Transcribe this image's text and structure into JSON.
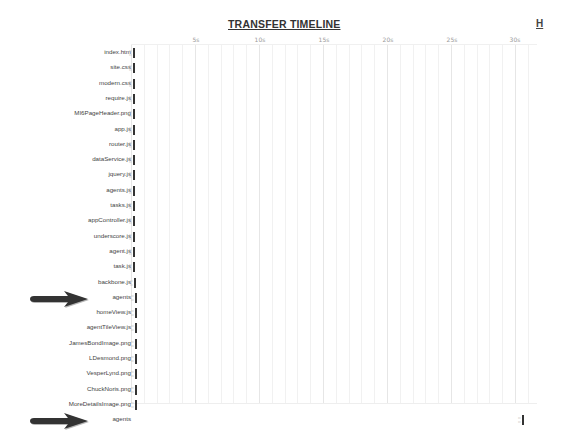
{
  "header": {
    "title": "TRANSFER TIMELINE",
    "corner_link": "H"
  },
  "axis": {
    "ticks": [
      {
        "label": "5s",
        "x": 196
      },
      {
        "label": "10s",
        "x": 260
      },
      {
        "label": "15s",
        "x": 324
      },
      {
        "label": "20s",
        "x": 388
      },
      {
        "label": "25s",
        "x": 452
      },
      {
        "label": "30s",
        "x": 515
      }
    ]
  },
  "timeline": {
    "rows": [
      {
        "label": "index.htm",
        "bar_x": 133
      },
      {
        "label": "site.css",
        "bar_x": 133
      },
      {
        "label": "modern.css",
        "bar_x": 133
      },
      {
        "label": "require.js",
        "bar_x": 133
      },
      {
        "label": "MI6PageHeader.png",
        "bar_x": 133
      },
      {
        "label": "app.js",
        "bar_x": 133
      },
      {
        "label": "router.js",
        "bar_x": 133
      },
      {
        "label": "dataService.js",
        "bar_x": 133
      },
      {
        "label": "jquery.js",
        "bar_x": 133
      },
      {
        "label": "agents.js",
        "bar_x": 133
      },
      {
        "label": "tasks.js",
        "bar_x": 133
      },
      {
        "label": "appController.js",
        "bar_x": 133
      },
      {
        "label": "underscore.js",
        "bar_x": 133
      },
      {
        "label": "agent.js",
        "bar_x": 133
      },
      {
        "label": "task.js",
        "bar_x": 133
      },
      {
        "label": "backbone.js",
        "bar_x": 134
      },
      {
        "label": "agents",
        "bar_x": 135,
        "arrow": true
      },
      {
        "label": "homeView.js",
        "bar_x": 135
      },
      {
        "label": "agentTileView.js",
        "bar_x": 135
      },
      {
        "label": "JamesBondImage.png",
        "bar_x": 135
      },
      {
        "label": "LDesmond.png",
        "bar_x": 135
      },
      {
        "label": "VesperLynd.png",
        "bar_x": 135
      },
      {
        "label": "ChuckNoris.png",
        "bar_x": 135
      },
      {
        "label": "MoreDetailsImage.png",
        "bar_x": 135
      },
      {
        "label": "agents",
        "bar_x": 522,
        "arrow": true
      }
    ]
  }
}
